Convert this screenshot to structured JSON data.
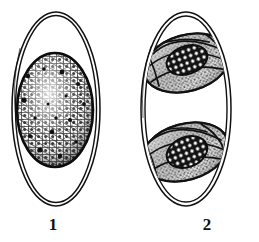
{
  "plate": {
    "background_color": "#ffffff",
    "ink_color": "#111111",
    "width": 259,
    "height": 242,
    "style": "scientific line illustration, stippled pen-and-ink"
  },
  "figures": [
    {
      "label": "1",
      "name": "unsporulated-oocyst",
      "description": "Oval double-walled oocyst containing a single rounded granular sporont",
      "shell": {
        "name": "oocyst-wall",
        "outline_count": 2,
        "outline_color": "#111111",
        "shape": "ellipse"
      },
      "contents": {
        "name": "sporont",
        "shape": "sphere",
        "texture": "coarse reticulate granules",
        "rim": "dark solid border"
      }
    },
    {
      "label": "2",
      "name": "sporulated-oocyst",
      "description": "Oval double-walled oocyst containing two sporocysts, each with stippled sporozoites and a dark reticulate residual body",
      "shell": {
        "name": "oocyst-wall",
        "outline_count": 2,
        "outline_color": "#111111",
        "shape": "ellipse"
      },
      "contents": {
        "name": "sporocysts",
        "count": 2,
        "sporocyst_labels": [
          "upper-sporocyst",
          "lower-sporocyst"
        ],
        "texture": "fine stipple",
        "residual_body": "dark reticulate mass"
      }
    }
  ],
  "captions": {
    "figure_1": "1",
    "figure_2": "2"
  }
}
